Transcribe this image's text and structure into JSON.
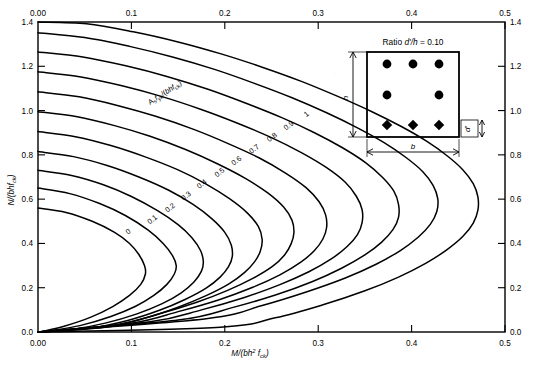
{
  "figure": {
    "title_visible": false,
    "inset": {
      "title": "Ratio d'/h = 0.10",
      "ratio_label_prefix": "Ratio",
      "ratio_symbol": "d'/h",
      "ratio_equals": "=",
      "ratio_value": "0.10",
      "dim_height_label": "h",
      "dim_width_label": "b",
      "dim_cover_label": "d'",
      "bar_rows": [
        {
          "shape": "circle",
          "count": 3
        },
        {
          "shape": "circle",
          "count": 2
        },
        {
          "shape": "diamond",
          "count": 3
        }
      ]
    }
  },
  "chart_data": {
    "type": "line",
    "title": "",
    "xlabel": "M/(bh² f ck)",
    "xlabel_parts": {
      "num": "M",
      "den_b": "b",
      "den_h": "h",
      "den_h_sup": "2",
      "den_f": "f",
      "den_f_sub": "ck"
    },
    "ylabel": "N/(bh f ck)",
    "ylabel_parts": {
      "num": "N",
      "den_b": "b",
      "den_h": "h",
      "den_f": "f",
      "den_f_sub": "ck"
    },
    "xlim": [
      0.0,
      0.5
    ],
    "ylim": [
      0.0,
      1.4
    ],
    "grid": false,
    "legend": "inline-curve-labels",
    "x_ticks_bottom": [
      "0.00",
      "0.1",
      "0.2",
      "0.3",
      "0.4",
      "0.5"
    ],
    "x_tick_values": [
      0.0,
      0.1,
      0.2,
      0.3,
      0.4,
      0.5
    ],
    "x_ticks_top": [
      "0.00",
      "0.1",
      "0.2",
      "0.3",
      "0.4",
      "0.5"
    ],
    "y_ticks_left": [
      "0.0",
      "0.2",
      "0.4",
      "0.6",
      "0.8",
      "1.0",
      "1.2",
      "1.4"
    ],
    "y_tick_values": [
      0.0,
      0.2,
      0.4,
      0.6,
      0.8,
      1.0,
      1.2,
      1.4
    ],
    "y_ticks_right": [
      "0.0",
      "0.2",
      "0.4",
      "0.6",
      "0.8",
      "1.0",
      "1.2",
      "1.4"
    ],
    "series_parameter_label": "Asfyk/(bhfck)",
    "series_parameter_parts": {
      "a": "A",
      "a_sub": "s",
      "f": "f",
      "f_sub": "yk",
      "den": "/(bhf",
      "den_sub": "ck",
      "close": ")"
    },
    "series": [
      {
        "name": "0",
        "label": "0",
        "label_pos": {
          "x": 0.098,
          "y": 0.445
        },
        "points": [
          [
            0.0,
            0.56
          ],
          [
            0.03,
            0.54
          ],
          [
            0.058,
            0.5
          ],
          [
            0.082,
            0.45
          ],
          [
            0.098,
            0.4
          ],
          [
            0.108,
            0.35
          ],
          [
            0.114,
            0.3
          ],
          [
            0.115,
            0.262
          ],
          [
            0.11,
            0.215
          ],
          [
            0.098,
            0.165
          ],
          [
            0.08,
            0.115
          ],
          [
            0.056,
            0.066
          ],
          [
            0.028,
            0.026
          ],
          [
            0.006,
            0.004
          ],
          [
            0.0,
            0.0
          ]
        ]
      },
      {
        "name": "0.1",
        "label": "0.1",
        "label_pos": {
          "x": 0.124,
          "y": 0.5
        },
        "points": [
          [
            0.0,
            0.65
          ],
          [
            0.034,
            0.625
          ],
          [
            0.066,
            0.58
          ],
          [
            0.094,
            0.525
          ],
          [
            0.118,
            0.46
          ],
          [
            0.134,
            0.4
          ],
          [
            0.144,
            0.345
          ],
          [
            0.148,
            0.3
          ],
          [
            0.146,
            0.262
          ],
          [
            0.138,
            0.215
          ],
          [
            0.124,
            0.165
          ],
          [
            0.104,
            0.115
          ],
          [
            0.078,
            0.07
          ],
          [
            0.046,
            0.03
          ],
          [
            0.014,
            0.006
          ],
          [
            0.0,
            0.0
          ]
        ]
      },
      {
        "name": "0.2",
        "label": "0.2",
        "label_pos": {
          "x": 0.143,
          "y": 0.553
        },
        "points": [
          [
            0.0,
            0.73
          ],
          [
            0.036,
            0.707
          ],
          [
            0.07,
            0.665
          ],
          [
            0.1,
            0.612
          ],
          [
            0.128,
            0.548
          ],
          [
            0.15,
            0.485
          ],
          [
            0.165,
            0.425
          ],
          [
            0.174,
            0.368
          ],
          [
            0.177,
            0.318
          ],
          [
            0.175,
            0.275
          ],
          [
            0.167,
            0.226
          ],
          [
            0.153,
            0.176
          ],
          [
            0.133,
            0.128
          ],
          [
            0.106,
            0.082
          ],
          [
            0.072,
            0.04
          ],
          [
            0.034,
            0.01
          ],
          [
            0.0,
            0.0
          ]
        ]
      },
      {
        "name": "0.3",
        "label": "0.3",
        "label_pos": {
          "x": 0.16,
          "y": 0.606
        },
        "points": [
          [
            0.0,
            0.815
          ],
          [
            0.038,
            0.792
          ],
          [
            0.074,
            0.752
          ],
          [
            0.108,
            0.7
          ],
          [
            0.14,
            0.64
          ],
          [
            0.166,
            0.576
          ],
          [
            0.186,
            0.512
          ],
          [
            0.2,
            0.45
          ],
          [
            0.207,
            0.392
          ],
          [
            0.208,
            0.34
          ],
          [
            0.204,
            0.295
          ],
          [
            0.195,
            0.248
          ],
          [
            0.18,
            0.198
          ],
          [
            0.158,
            0.148
          ],
          [
            0.13,
            0.098
          ],
          [
            0.096,
            0.052
          ],
          [
            0.054,
            0.016
          ],
          [
            0.0,
            0.0
          ]
        ]
      },
      {
        "name": "0.4",
        "label": "0.4",
        "label_pos": {
          "x": 0.177,
          "y": 0.66
        },
        "points": [
          [
            0.0,
            0.905
          ],
          [
            0.04,
            0.882
          ],
          [
            0.078,
            0.842
          ],
          [
            0.114,
            0.792
          ],
          [
            0.15,
            0.732
          ],
          [
            0.18,
            0.668
          ],
          [
            0.205,
            0.602
          ],
          [
            0.224,
            0.538
          ],
          [
            0.236,
            0.476
          ],
          [
            0.24,
            0.418
          ],
          [
            0.238,
            0.365
          ],
          [
            0.232,
            0.318
          ],
          [
            0.221,
            0.268
          ],
          [
            0.204,
            0.216
          ],
          [
            0.18,
            0.164
          ],
          [
            0.15,
            0.112
          ],
          [
            0.114,
            0.062
          ],
          [
            0.07,
            0.02
          ],
          [
            0.0,
            0.0
          ]
        ]
      },
      {
        "name": "0.5",
        "label": "0.5",
        "label_pos": {
          "x": 0.196,
          "y": 0.712
        },
        "points": [
          [
            0.0,
            0.995
          ],
          [
            0.042,
            0.972
          ],
          [
            0.082,
            0.932
          ],
          [
            0.12,
            0.884
          ],
          [
            0.158,
            0.824
          ],
          [
            0.192,
            0.76
          ],
          [
            0.222,
            0.694
          ],
          [
            0.246,
            0.628
          ],
          [
            0.263,
            0.564
          ],
          [
            0.272,
            0.504
          ],
          [
            0.274,
            0.448
          ],
          [
            0.271,
            0.398
          ],
          [
            0.264,
            0.348
          ],
          [
            0.251,
            0.296
          ],
          [
            0.23,
            0.242
          ],
          [
            0.203,
            0.188
          ],
          [
            0.17,
            0.134
          ],
          [
            0.13,
            0.082
          ],
          [
            0.082,
            0.032
          ],
          [
            0.0,
            0.0
          ]
        ]
      },
      {
        "name": "0.6",
        "label": "0.6",
        "label_pos": {
          "x": 0.214,
          "y": 0.765
        },
        "points": [
          [
            0.0,
            1.085
          ],
          [
            0.044,
            1.062
          ],
          [
            0.086,
            1.022
          ],
          [
            0.126,
            0.974
          ],
          [
            0.166,
            0.916
          ],
          [
            0.203,
            0.852
          ],
          [
            0.237,
            0.786
          ],
          [
            0.265,
            0.718
          ],
          [
            0.287,
            0.652
          ],
          [
            0.301,
            0.588
          ],
          [
            0.308,
            0.528
          ],
          [
            0.309,
            0.472
          ],
          [
            0.305,
            0.42
          ],
          [
            0.296,
            0.368
          ],
          [
            0.281,
            0.314
          ],
          [
            0.259,
            0.258
          ],
          [
            0.23,
            0.202
          ],
          [
            0.194,
            0.146
          ],
          [
            0.15,
            0.092
          ],
          [
            0.1,
            0.04
          ],
          [
            0.0,
            0.0
          ]
        ]
      },
      {
        "name": "0.7",
        "label": "0.7",
        "label_pos": {
          "x": 0.233,
          "y": 0.818
        },
        "points": [
          [
            0.0,
            1.175
          ],
          [
            0.046,
            1.152
          ],
          [
            0.09,
            1.112
          ],
          [
            0.132,
            1.064
          ],
          [
            0.174,
            1.006
          ],
          [
            0.213,
            0.944
          ],
          [
            0.25,
            0.878
          ],
          [
            0.282,
            0.81
          ],
          [
            0.309,
            0.742
          ],
          [
            0.329,
            0.676
          ],
          [
            0.341,
            0.612
          ],
          [
            0.347,
            0.552
          ],
          [
            0.347,
            0.494
          ],
          [
            0.342,
            0.44
          ],
          [
            0.331,
            0.386
          ],
          [
            0.314,
            0.33
          ],
          [
            0.29,
            0.272
          ],
          [
            0.259,
            0.214
          ],
          [
            0.221,
            0.156
          ],
          [
            0.175,
            0.1
          ],
          [
            0.12,
            0.046
          ],
          [
            0.0,
            0.0
          ]
        ]
      },
      {
        "name": "0.8",
        "label": "0.8",
        "label_pos": {
          "x": 0.252,
          "y": 0.871
        },
        "points": [
          [
            0.0,
            1.265
          ],
          [
            0.048,
            1.242
          ],
          [
            0.094,
            1.202
          ],
          [
            0.138,
            1.154
          ],
          [
            0.182,
            1.096
          ],
          [
            0.222,
            1.034
          ],
          [
            0.261,
            0.968
          ],
          [
            0.296,
            0.9
          ],
          [
            0.326,
            0.832
          ],
          [
            0.351,
            0.764
          ],
          [
            0.369,
            0.698
          ],
          [
            0.381,
            0.636
          ],
          [
            0.386,
            0.576
          ],
          [
            0.386,
            0.518
          ],
          [
            0.38,
            0.462
          ],
          [
            0.368,
            0.406
          ],
          [
            0.35,
            0.348
          ],
          [
            0.325,
            0.288
          ],
          [
            0.294,
            0.228
          ],
          [
            0.255,
            0.168
          ],
          [
            0.208,
            0.11
          ],
          [
            0.15,
            0.054
          ],
          [
            0.0,
            0.0
          ]
        ]
      },
      {
        "name": "0.9",
        "label": "0.9",
        "label_pos": {
          "x": 0.27,
          "y": 0.924
        },
        "points": [
          [
            0.0,
            1.352
          ],
          [
            0.05,
            1.33
          ],
          [
            0.098,
            1.29
          ],
          [
            0.144,
            1.242
          ],
          [
            0.189,
            1.186
          ],
          [
            0.231,
            1.124
          ],
          [
            0.272,
            1.058
          ],
          [
            0.309,
            0.99
          ],
          [
            0.342,
            0.922
          ],
          [
            0.371,
            0.854
          ],
          [
            0.394,
            0.788
          ],
          [
            0.412,
            0.724
          ],
          [
            0.423,
            0.662
          ],
          [
            0.428,
            0.602
          ],
          [
            0.427,
            0.544
          ],
          [
            0.42,
            0.486
          ],
          [
            0.407,
            0.428
          ],
          [
            0.388,
            0.368
          ],
          [
            0.362,
            0.306
          ],
          [
            0.329,
            0.244
          ],
          [
            0.288,
            0.182
          ],
          [
            0.24,
            0.12
          ],
          [
            0.18,
            0.06
          ],
          [
            0.0,
            0.0
          ]
        ]
      },
      {
        "name": "1",
        "label": "1",
        "label_pos": {
          "x": 0.289,
          "y": 0.975
        },
        "points": [
          [
            0.0,
            1.4
          ],
          [
            0.052,
            1.392
          ],
          [
            0.102,
            1.356
          ],
          [
            0.15,
            1.31
          ],
          [
            0.196,
            1.256
          ],
          [
            0.24,
            1.196
          ],
          [
            0.282,
            1.132
          ],
          [
            0.321,
            1.064
          ],
          [
            0.357,
            0.996
          ],
          [
            0.389,
            0.928
          ],
          [
            0.416,
            0.862
          ],
          [
            0.438,
            0.796
          ],
          [
            0.455,
            0.732
          ],
          [
            0.466,
            0.67
          ],
          [
            0.471,
            0.61
          ],
          [
            0.471,
            0.55
          ],
          [
            0.466,
            0.492
          ],
          [
            0.455,
            0.432
          ],
          [
            0.438,
            0.372
          ],
          [
            0.415,
            0.31
          ],
          [
            0.386,
            0.248
          ],
          [
            0.35,
            0.186
          ],
          [
            0.306,
            0.124
          ],
          [
            0.254,
            0.064
          ],
          [
            0.195,
            0.022
          ],
          [
            0.0,
            0.0
          ]
        ]
      }
    ]
  }
}
